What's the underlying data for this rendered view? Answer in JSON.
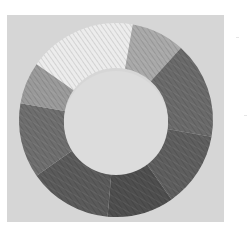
{
  "image": {
    "description": "Pencil-drawn grayscale value wheel: a ring divided into shaded segments on a light gray paper square",
    "background_color": "#ffffff",
    "paper_color": "#d6d6d6",
    "center_color": "#dcdcdc",
    "wheel": {
      "center": [
        116,
        120
      ],
      "outer_radius": 97,
      "inner_radius": 52,
      "segments": [
        {
          "name": "lightest",
          "start_deg": -55,
          "end_deg": 10,
          "color": "#ececec"
        },
        {
          "name": "light",
          "start_deg": 10,
          "end_deg": 42,
          "color": "#a9a9a9"
        },
        {
          "name": "dark",
          "start_deg": 42,
          "end_deg": 100,
          "color": "#6a6a6a"
        },
        {
          "name": "darker",
          "start_deg": 100,
          "end_deg": 145,
          "color": "#5e5e5e"
        },
        {
          "name": "darkest",
          "start_deg": 145,
          "end_deg": 185,
          "color": "#4e4e4e"
        },
        {
          "name": "very-dark",
          "start_deg": 185,
          "end_deg": 235,
          "color": "#5a5a5a"
        },
        {
          "name": "medium-dark",
          "start_deg": 235,
          "end_deg": 280,
          "color": "#6e6e6e"
        },
        {
          "name": "medium",
          "start_deg": 280,
          "end_deg": 305,
          "color": "#9a9a9a"
        }
      ]
    }
  }
}
